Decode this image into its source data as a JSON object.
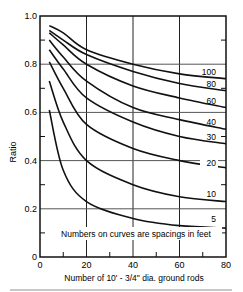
{
  "chart_data": {
    "type": "line",
    "title": "",
    "xlabel": "Number of 10' - 3/4\" dia. ground rods",
    "ylabel": "Ratio",
    "xlim": [
      0,
      80
    ],
    "ylim": [
      0,
      1.0
    ],
    "x_ticks": [
      "0",
      "20",
      "40",
      "60",
      "80"
    ],
    "y_ticks": [
      "0",
      "0.2",
      "0.4",
      "0.6",
      "0.8",
      "1.0"
    ],
    "grid": true,
    "annotation": "Numbers on curves are spacings in feet",
    "x": [
      4,
      10,
      20,
      40,
      60,
      80
    ],
    "series": [
      {
        "name": "100",
        "values": [
          0.96,
          0.93,
          0.86,
          0.8,
          0.76,
          0.74
        ]
      },
      {
        "name": "80",
        "values": [
          0.94,
          0.9,
          0.84,
          0.77,
          0.72,
          0.69
        ]
      },
      {
        "name": "60",
        "values": [
          0.93,
          0.88,
          0.8,
          0.71,
          0.66,
          0.62
        ]
      },
      {
        "name": "40",
        "values": [
          0.9,
          0.83,
          0.73,
          0.62,
          0.57,
          0.53
        ]
      },
      {
        "name": "30",
        "values": [
          0.86,
          0.78,
          0.66,
          0.56,
          0.5,
          0.47
        ]
      },
      {
        "name": "20",
        "values": [
          0.81,
          0.7,
          0.55,
          0.45,
          0.4,
          0.37
        ]
      },
      {
        "name": "10",
        "values": [
          0.73,
          0.56,
          0.4,
          0.3,
          0.25,
          0.23
        ]
      },
      {
        "name": "5",
        "values": [
          0.61,
          0.36,
          0.23,
          0.16,
          0.13,
          0.12
        ]
      }
    ]
  }
}
